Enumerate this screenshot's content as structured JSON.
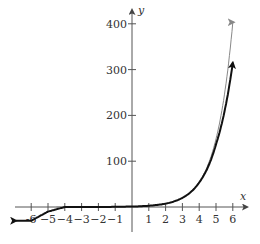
{
  "chart_data": {
    "type": "line",
    "title": "",
    "xlabel": "x",
    "ylabel": "y",
    "xlim": [
      -6.8,
      6.6
    ],
    "ylim": [
      -40,
      430
    ],
    "grid": false,
    "legend": null,
    "x_ticks": [
      -6,
      -5,
      -4,
      -3,
      -2,
      -1,
      1,
      2,
      3,
      4,
      5,
      6
    ],
    "x_tick_labels": [
      "-6",
      "−5",
      "−4",
      "−3",
      "−2",
      "−1",
      "1",
      "2",
      "3",
      "4",
      "5",
      "6"
    ],
    "y_ticks": [
      100,
      200,
      300,
      400
    ],
    "y_tick_labels": [
      "100",
      "200",
      "300",
      "400"
    ],
    "series": [
      {
        "name": "gray curve (e^x)",
        "color": "#888888",
        "width": 1,
        "x": [
          -6,
          -5,
          -4,
          -3,
          -2,
          -1,
          0,
          1,
          2,
          3,
          4,
          5,
          6
        ],
        "values": [
          0.0,
          0.0,
          0.0,
          0.05,
          0.1,
          0.4,
          1,
          2.7,
          7.4,
          20.1,
          54.6,
          148.4,
          403.4
        ]
      },
      {
        "name": "black curve (polynomial approximation)",
        "color": "#111111",
        "width": 2,
        "x": [
          -6,
          -5,
          -4,
          -3,
          -2,
          -1,
          0,
          1,
          2,
          3,
          4,
          5,
          6
        ],
        "values": [
          -30,
          -10,
          0,
          0.0,
          0.1,
          0.4,
          1,
          2.7,
          7.4,
          20.0,
          53.4,
          136.6,
          315
        ]
      }
    ]
  }
}
